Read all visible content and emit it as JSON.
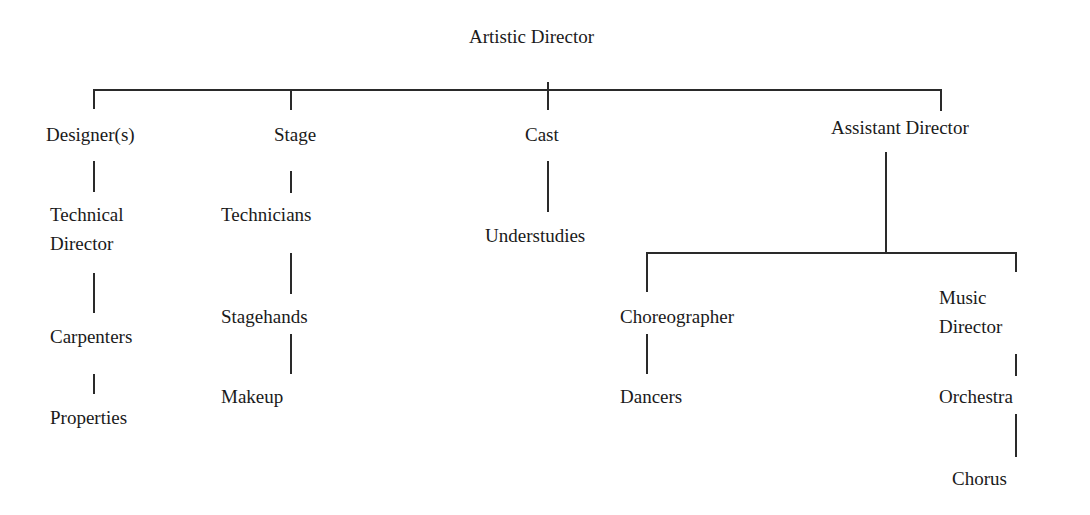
{
  "diagram": {
    "type": "org-chart",
    "root": {
      "label": "Artistic Director"
    },
    "departments": [
      {
        "label": "Designer(s)",
        "children": [
          "Technical Director",
          "Carpenters",
          "Properties"
        ]
      },
      {
        "label": "Stage",
        "children": [
          "Technicians",
          "Stagehands",
          "Makeup"
        ]
      },
      {
        "label": "Cast",
        "children": [
          "Understudies"
        ]
      },
      {
        "label": "Assistant Director",
        "branches": [
          {
            "label": "Choreographer",
            "children": [
              "Dancers"
            ]
          },
          {
            "label": "Music Director",
            "children": [
              "Orchestra",
              "Chorus"
            ]
          }
        ]
      }
    ]
  },
  "labels": {
    "artistic_director": "Artistic Director",
    "designers": "Designer(s)",
    "technical": "Technical",
    "director_td": "Director",
    "carpenters": "Carpenters",
    "properties": "Properties",
    "stage": "Stage",
    "technicians": "Technicians",
    "stagehands": "Stagehands",
    "makeup": "Makeup",
    "cast": "Cast",
    "understudies": "Understudies",
    "assistant_director": "Assistant Director",
    "choreographer": "Choreographer",
    "dancers": "Dancers",
    "music": "Music",
    "director_md": "Director",
    "orchestra": "Orchestra",
    "chorus": "Chorus"
  }
}
